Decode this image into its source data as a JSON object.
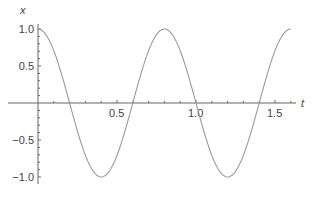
{
  "chart_data": {
    "type": "line",
    "title": "",
    "xlabel": "t",
    "ylabel": "x",
    "xlim": [
      0,
      1.6
    ],
    "ylim": [
      -1.0,
      1.0
    ],
    "x_ticks": [
      "0.5",
      "1.0",
      "1.5"
    ],
    "y_ticks": [
      "1.0",
      "0.5",
      "-0.5",
      "-1.0"
    ],
    "grid": false,
    "legend": null,
    "series": [
      {
        "name": "x(t) = cos(2πt/0.8)",
        "color": "#9a9a9a",
        "x": [
          0,
          0.1,
          0.2,
          0.3,
          0.4,
          0.5,
          0.6,
          0.7,
          0.8,
          0.9,
          1.0,
          1.1,
          1.2,
          1.3,
          1.4,
          1.5,
          1.6
        ],
        "values": [
          1.0,
          0.707,
          0.0,
          -0.707,
          -1.0,
          -0.707,
          0.0,
          0.707,
          1.0,
          0.707,
          0.0,
          -0.707,
          -1.0,
          -0.707,
          0.0,
          0.707,
          1.0
        ]
      }
    ]
  }
}
